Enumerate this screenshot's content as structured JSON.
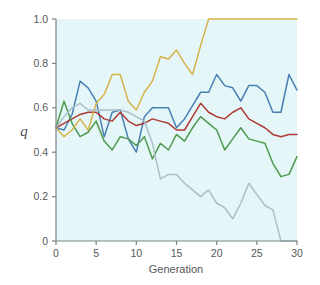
{
  "chart_data": {
    "type": "line",
    "title": "",
    "xlabel": "Generation",
    "ylabel": "q",
    "xlim": [
      0,
      30
    ],
    "ylim": [
      0,
      1.0
    ],
    "grid": false,
    "legend": "none",
    "plot_background": "#e4f6f7",
    "xticks": [
      0,
      5,
      10,
      15,
      20,
      25,
      30
    ],
    "xtick_labels": [
      "0",
      "5",
      "10",
      "15",
      "20",
      "25",
      "30"
    ],
    "yticks": [
      0,
      0.2,
      0.4,
      0.6,
      0.8,
      1.0
    ],
    "ytick_labels": [
      "0",
      "0.2",
      "0.4",
      "0.6",
      "0.8",
      "1.0"
    ],
    "x": [
      0,
      1,
      2,
      3,
      4,
      5,
      6,
      7,
      8,
      9,
      10,
      11,
      12,
      13,
      14,
      15,
      16,
      17,
      18,
      19,
      20,
      21,
      22,
      23,
      24,
      25,
      26,
      27,
      28,
      29,
      30
    ],
    "series": [
      {
        "name": "replicate-1",
        "color": "#4a7fb5",
        "values": [
          0.51,
          0.5,
          0.57,
          0.72,
          0.69,
          0.63,
          0.47,
          0.58,
          0.59,
          0.46,
          0.4,
          0.56,
          0.6,
          0.6,
          0.6,
          0.51,
          0.55,
          0.61,
          0.67,
          0.67,
          0.75,
          0.7,
          0.69,
          0.63,
          0.7,
          0.7,
          0.67,
          0.58,
          0.58,
          0.75,
          0.68
        ]
      },
      {
        "name": "replicate-2",
        "color": "#ad3a33",
        "values": [
          0.51,
          0.53,
          0.55,
          0.57,
          0.58,
          0.58,
          0.55,
          0.54,
          0.58,
          0.54,
          0.52,
          0.53,
          0.55,
          0.54,
          0.53,
          0.5,
          0.5,
          0.56,
          0.62,
          0.58,
          0.56,
          0.55,
          0.58,
          0.6,
          0.55,
          0.53,
          0.51,
          0.48,
          0.47,
          0.48,
          0.48
        ]
      },
      {
        "name": "replicate-3",
        "color": "#4e9a4e",
        "values": [
          0.51,
          0.63,
          0.53,
          0.47,
          0.49,
          0.54,
          0.45,
          0.41,
          0.47,
          0.46,
          0.43,
          0.47,
          0.37,
          0.44,
          0.41,
          0.48,
          0.45,
          0.51,
          0.56,
          0.53,
          0.5,
          0.41,
          0.46,
          0.51,
          0.46,
          0.45,
          0.44,
          0.35,
          0.29,
          0.3,
          0.38
        ]
      },
      {
        "name": "replicate-4",
        "color": "#d7b24b",
        "values": [
          0.51,
          0.47,
          0.5,
          0.55,
          0.5,
          0.62,
          0.66,
          0.75,
          0.75,
          0.63,
          0.59,
          0.67,
          0.72,
          0.83,
          0.82,
          0.86,
          0.8,
          0.75,
          0.88,
          1.0,
          1.0,
          1.0,
          1.0,
          1.0,
          1.0,
          1.0,
          1.0,
          1.0,
          1.0,
          1.0,
          1.0
        ]
      },
      {
        "name": "replicate-5",
        "color": "#a9c0c8",
        "values": [
          0.51,
          0.56,
          0.6,
          0.62,
          0.59,
          0.59,
          0.59,
          0.59,
          0.59,
          0.58,
          0.56,
          0.54,
          0.44,
          0.28,
          0.3,
          0.3,
          0.26,
          0.23,
          0.2,
          0.23,
          0.17,
          0.15,
          0.1,
          0.17,
          0.26,
          0.21,
          0.16,
          0.14,
          0.0,
          0.0,
          0.0
        ]
      }
    ]
  },
  "figure": {
    "axis_color": "#7a8486",
    "text_color": "#55585a"
  }
}
